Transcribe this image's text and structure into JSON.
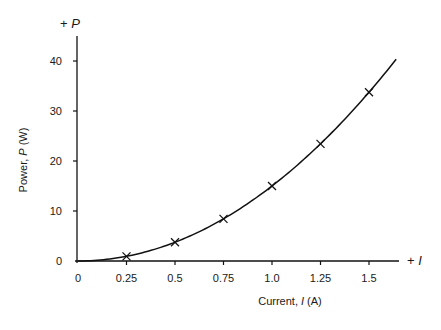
{
  "chart_data": {
    "type": "line",
    "title": "",
    "xlabel": "Current, I (A)",
    "ylabel": "Power, P (W)",
    "x_axis_end_label": "+ I",
    "y_axis_end_label": "+ P",
    "xlim": [
      0,
      1.65
    ],
    "ylim": [
      0,
      45
    ],
    "x_ticks": [
      0,
      0.25,
      0.5,
      0.75,
      1.0,
      1.25,
      1.5
    ],
    "x_tick_labels": [
      "0",
      "0.25",
      "0.5",
      "0.75",
      "1.0",
      "1.25",
      "1.5"
    ],
    "y_ticks": [
      0,
      10,
      20,
      30,
      40
    ],
    "y_tick_labels": [
      "0",
      "10",
      "20",
      "30",
      "40"
    ],
    "grid": false,
    "legend": null,
    "series": [
      {
        "name": "P = 15 I^2",
        "style": "smooth curve",
        "x": [
          0,
          0.25,
          0.5,
          0.75,
          1.0,
          1.25,
          1.5,
          1.64
        ],
        "values": [
          0,
          0.94,
          3.75,
          8.44,
          15.0,
          23.44,
          33.75,
          40.3
        ]
      },
      {
        "name": "measured points",
        "style": "markers (x-cross)",
        "x": [
          0.25,
          0.5,
          0.75,
          1.0,
          1.25,
          1.5
        ],
        "values": [
          0.94,
          3.75,
          8.44,
          15.0,
          23.44,
          33.75
        ]
      }
    ]
  },
  "labels": {
    "xlabel_prefix": "Current, ",
    "xlabel_var": "I",
    "xlabel_unit": " (A)",
    "ylabel_prefix": "Power, ",
    "ylabel_var": "P",
    "ylabel_unit": " (W)",
    "x_end_plus": "+ ",
    "x_end_var": "I",
    "y_end_plus": "+ ",
    "y_end_var": "P"
  }
}
